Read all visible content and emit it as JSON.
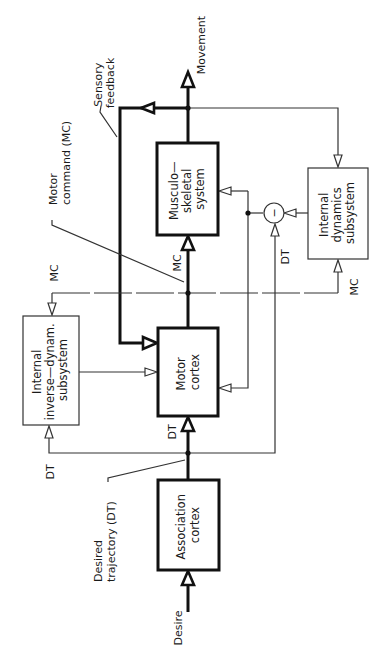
{
  "diagram": {
    "orientation": "rotated-90-ccw",
    "blocks": {
      "association_cortex": [
        "Association",
        "cortex"
      ],
      "motor_cortex": [
        "Motor",
        "cortex"
      ],
      "musculoskeletal": [
        "Musculo—",
        "skeletal",
        "system"
      ],
      "internal_dynamics": [
        "Internal",
        "dynamics",
        "subsystem"
      ],
      "internal_inverse_dynamics": [
        "Internal",
        "inverse—dynam.",
        "subsystem"
      ]
    },
    "comparator_symbol": "−",
    "labels": {
      "desire": "Desire",
      "movement": "Movement",
      "desired_trajectory": [
        "Desired",
        "trajectory  (DT)"
      ],
      "motor_command": [
        "Motor",
        "command  (MC)"
      ],
      "sensory_feedback": [
        "Sensory",
        "feedback"
      ],
      "mc": "MC",
      "dt": "DT"
    },
    "edges": [
      {
        "from": "Desire",
        "to": "Association cortex"
      },
      {
        "from": "Association cortex",
        "to": "Motor cortex",
        "label": "DT"
      },
      {
        "from": "DT",
        "to": "Internal inverse-dynam. subsystem"
      },
      {
        "from": "DT",
        "to": "Comparator"
      },
      {
        "from": "Motor cortex",
        "to": "Musculo-skeletal system",
        "label": "MC"
      },
      {
        "from": "MC",
        "to": "Internal inverse-dynam. subsystem"
      },
      {
        "from": "MC",
        "to": "Internal dynamics subsystem"
      },
      {
        "from": "Internal inverse-dynam. subsystem",
        "to": "Motor cortex"
      },
      {
        "from": "Musculo-skeletal system",
        "to": "Movement"
      },
      {
        "from": "Movement",
        "to": "Motor cortex",
        "label": "Sensory feedback"
      },
      {
        "from": "Movement",
        "to": "Internal dynamics subsystem"
      },
      {
        "from": "Internal dynamics subsystem",
        "to": "Comparator"
      },
      {
        "from": "Comparator",
        "to": "Musculo-skeletal system"
      },
      {
        "from": "Comparator",
        "to": "Motor cortex"
      }
    ]
  }
}
